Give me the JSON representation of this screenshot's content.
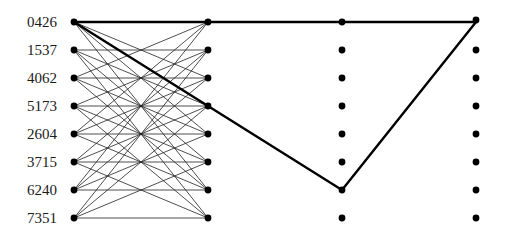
{
  "diagram": {
    "type": "layered-network-path",
    "columns_x": [
      74,
      208,
      342,
      476
    ],
    "rows_y": [
      22,
      50,
      78,
      106,
      134,
      162,
      190,
      218
    ],
    "row_labels": [
      "0426",
      "1537",
      "4062",
      "5173",
      "2604",
      "3715",
      "6240",
      "7351"
    ],
    "thin_edges_rule": "each left node connects to the column-2 nodes indexed by the digits of its label",
    "highlighted_path": [
      {
        "col": 0,
        "row": 0
      },
      {
        "col": 1,
        "row": 0
      },
      {
        "col": 2,
        "row": 0
      },
      {
        "col": 3,
        "row": 0
      },
      {
        "col": 2,
        "row": 6
      },
      {
        "col": 0,
        "row": 0
      }
    ],
    "highlighted_segments": [
      [
        [
          0,
          0
        ],
        [
          1,
          0
        ]
      ],
      [
        [
          1,
          0
        ],
        [
          3,
          0
        ]
      ],
      [
        [
          3,
          0
        ],
        [
          2,
          6
        ]
      ],
      [
        [
          2,
          6
        ],
        [
          0,
          0
        ]
      ]
    ],
    "colors": {
      "lines": "#000000",
      "nodes": "#000000",
      "background": "#ffffff"
    }
  }
}
